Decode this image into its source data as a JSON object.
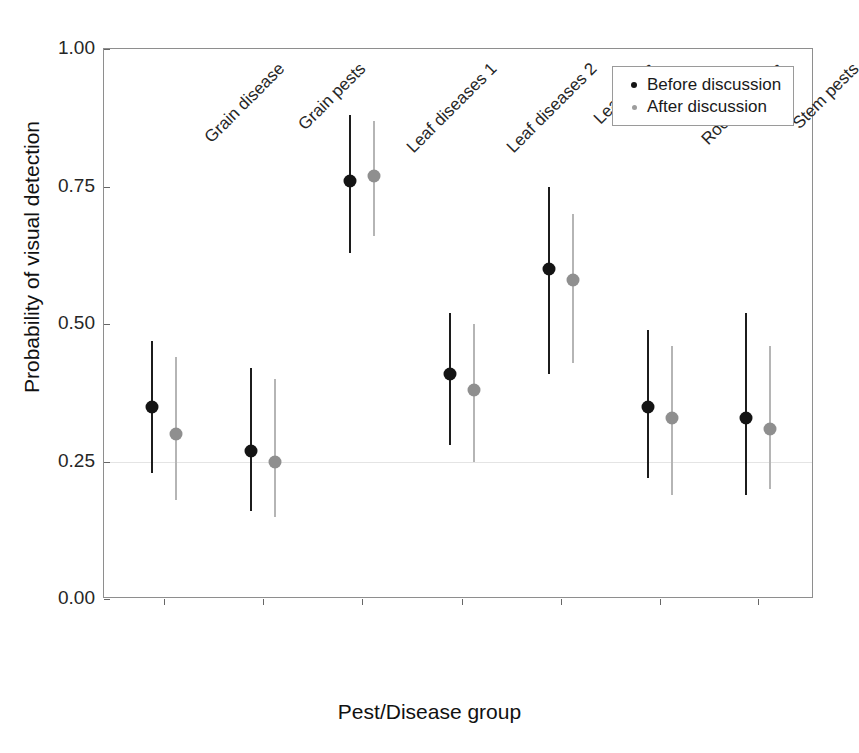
{
  "chart_data": {
    "type": "scatter",
    "title": "",
    "xlabel": "Pest/Disease group",
    "ylabel": "Probability of visual detection",
    "ylim": [
      0.0,
      1.0
    ],
    "yticks": [
      0.0,
      0.25,
      0.5,
      0.75,
      1.0
    ],
    "ytick_labels": [
      "0.00",
      "0.25",
      "0.50",
      "0.75",
      "1.00"
    ],
    "grid": "horizontal gridline at 0.25 only",
    "legend_position": "top-right inside panel",
    "categories": [
      "Grain disease",
      "Grain pests",
      "Leaf diseases 1",
      "Leaf diseases 2",
      "Leaf pests",
      "Root diseases",
      "Stem pests"
    ],
    "series": [
      {
        "name": "Before discussion",
        "color": "#141414",
        "values": [
          0.35,
          0.27,
          0.76,
          0.41,
          0.6,
          0.35,
          0.33
        ],
        "ci_lower": [
          0.23,
          0.16,
          0.63,
          0.28,
          0.41,
          0.22,
          0.19
        ],
        "ci_upper": [
          0.47,
          0.42,
          0.88,
          0.52,
          0.75,
          0.49,
          0.52
        ]
      },
      {
        "name": "After discussion",
        "color": "#8f8f8f",
        "values": [
          0.3,
          0.25,
          0.77,
          0.38,
          0.58,
          0.33,
          0.31
        ],
        "ci_lower": [
          0.18,
          0.15,
          0.66,
          0.25,
          0.43,
          0.19,
          0.2
        ],
        "ci_upper": [
          0.44,
          0.4,
          0.87,
          0.5,
          0.7,
          0.46,
          0.46
        ]
      }
    ]
  },
  "legend": {
    "entries": [
      {
        "label": "Before discussion",
        "marker": "filled-circle-black"
      },
      {
        "label": "After discussion",
        "marker": "filled-circle-gray"
      }
    ]
  }
}
